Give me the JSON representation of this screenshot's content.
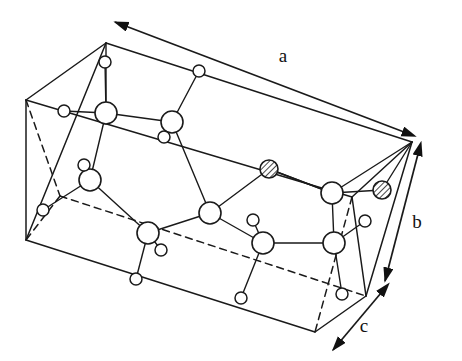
{
  "figure": {
    "kind": "crystal-structure-unit-cell",
    "background_color": "#ffffff",
    "line_color": "#1a1a1a"
  },
  "axis_labels": {
    "a": "a",
    "b": "b",
    "c": "c"
  },
  "axes": [
    {
      "id": "a",
      "label": "a",
      "label_x": 283,
      "label_y": 62,
      "arrow": "double",
      "x1": 404,
      "y1": 132,
      "x2": 115,
      "y2": 22
    },
    {
      "id": "b",
      "label": "b",
      "label_x": 417,
      "label_y": 228,
      "arrow": "double",
      "x1": 418,
      "y1": 154,
      "x2": 385,
      "y2": 281
    },
    {
      "id": "c",
      "label": "c",
      "label_x": 364,
      "label_y": 332,
      "arrow": "double",
      "x1": 381,
      "y1": 293,
      "x2": 333,
      "y2": 350
    }
  ],
  "cell": {
    "vertices": {
      "top_back_left": [
        106,
        43
      ],
      "top_back_right": [
        412,
        142
      ],
      "top_front_left": [
        26,
        100
      ],
      "top_front_right": [
        352,
        197
      ],
      "bottom_back_left": [
        60,
        196
      ],
      "bottom_back_right": [
        366,
        296
      ],
      "bottom_front_left": [
        26,
        240
      ],
      "bottom_front_right": [
        315,
        332
      ]
    },
    "solid_edges": [
      [
        106,
        43,
        412,
        142
      ],
      [
        106,
        43,
        26,
        100
      ],
      [
        26,
        100,
        26,
        240
      ],
      [
        412,
        142,
        366,
        296
      ],
      [
        26,
        240,
        315,
        332
      ],
      [
        315,
        332,
        366,
        296
      ],
      [
        26,
        100,
        352,
        197
      ],
      [
        352,
        197,
        412,
        142
      ],
      [
        26,
        240,
        106,
        43
      ],
      [
        352,
        197,
        366,
        296
      ]
    ],
    "dashed_edges": [
      [
        26,
        100,
        60,
        196
      ],
      [
        60,
        196,
        366,
        296
      ],
      [
        60,
        196,
        26,
        240
      ],
      [
        352,
        197,
        315,
        332
      ]
    ]
  },
  "atom_types": [
    {
      "name": "large-open-circle",
      "style": "open",
      "radius": 11,
      "role": "framework cation site"
    },
    {
      "name": "small-open-circle",
      "style": "open",
      "radius": 6,
      "role": "light anion / hydrogen site"
    },
    {
      "name": "hatched-circle",
      "style": "hatched",
      "radius": 9,
      "role": "substituted / distinct atom site"
    }
  ],
  "atoms": {
    "large": [
      [
        106,
        113
      ],
      [
        172,
        122
      ],
      [
        90,
        180
      ],
      [
        210,
        213
      ],
      [
        148,
        233
      ],
      [
        263,
        243
      ],
      [
        334,
        243
      ],
      [
        332,
        193
      ]
    ],
    "small": [
      [
        105,
        62
      ],
      [
        199,
        71
      ],
      [
        64,
        111
      ],
      [
        164,
        137
      ],
      [
        84,
        165
      ],
      [
        43,
        210
      ],
      [
        161,
        250
      ],
      [
        253,
        220
      ],
      [
        365,
        221
      ],
      [
        136,
        279
      ],
      [
        241,
        298
      ],
      [
        342,
        294
      ]
    ],
    "hatched": [
      [
        269,
        169
      ],
      [
        382,
        190
      ]
    ]
  },
  "bonds": [
    [
      106,
      113,
      105,
      62
    ],
    [
      106,
      113,
      64,
      111
    ],
    [
      106,
      113,
      106,
      43
    ],
    [
      106,
      113,
      172,
      122
    ],
    [
      106,
      113,
      90,
      180
    ],
    [
      172,
      122,
      199,
      71
    ],
    [
      172,
      122,
      164,
      137
    ],
    [
      172,
      122,
      210,
      213
    ],
    [
      90,
      180,
      84,
      165
    ],
    [
      90,
      180,
      43,
      210
    ],
    [
      90,
      180,
      148,
      233
    ],
    [
      210,
      213,
      269,
      169
    ],
    [
      210,
      213,
      148,
      233
    ],
    [
      210,
      213,
      263,
      243
    ],
    [
      148,
      233,
      161,
      250
    ],
    [
      148,
      233,
      136,
      279
    ],
    [
      263,
      243,
      253,
      220
    ],
    [
      263,
      243,
      241,
      298
    ],
    [
      263,
      243,
      334,
      243
    ],
    [
      334,
      243,
      332,
      193
    ],
    [
      334,
      243,
      365,
      221
    ],
    [
      334,
      243,
      342,
      294
    ],
    [
      332,
      193,
      269,
      169
    ],
    [
      332,
      193,
      382,
      190
    ],
    [
      332,
      193,
      412,
      142
    ],
    [
      382,
      190,
      412,
      142
    ],
    [
      269,
      169,
      332,
      193
    ]
  ]
}
